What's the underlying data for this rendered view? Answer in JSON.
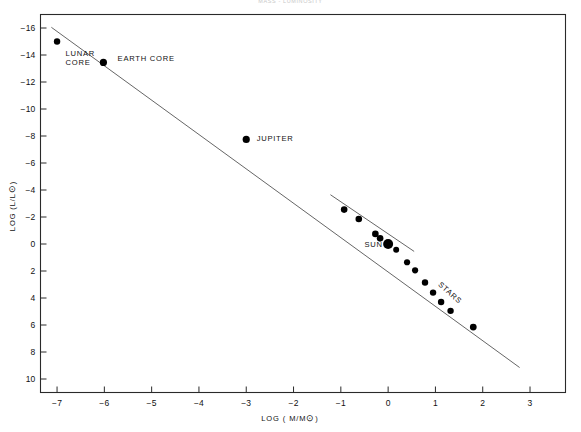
{
  "figure": {
    "faint_header": "MASS - LUMINOSITY",
    "background_color": "#ffffff",
    "ink_color": "#000000",
    "line_color": "#555555"
  },
  "chart_data": {
    "type": "scatter",
    "title": "",
    "xlabel": "LOG ( M/M⊙)",
    "ylabel": "LOG (L/L⊙)",
    "xlim": [
      -7.35,
      3.75
    ],
    "ylim_display_top": -17.0,
    "ylim_display_bottom": 11.0,
    "y_axis_inverted": true,
    "grid": false,
    "legend": "none",
    "xticks": [
      -7,
      -6,
      -5,
      -4,
      -3,
      -2,
      -1,
      0,
      1,
      2,
      3
    ],
    "xtick_labels": [
      "-7",
      "-6",
      "-5",
      "-4",
      "-3",
      "-2",
      "-1",
      "0",
      "1",
      "2",
      "3"
    ],
    "yticks": [
      -16,
      -14,
      -12,
      -10,
      -8,
      -6,
      -4,
      -2,
      0,
      2,
      4,
      6,
      8,
      10
    ],
    "ytick_labels": [
      "-16",
      "-14",
      "-12",
      "-10",
      "-8",
      "-6",
      "-4",
      "-2",
      "0",
      "2",
      "4",
      "6",
      "8",
      "10"
    ],
    "points": [
      {
        "name": "lunar-core",
        "x": -7.0,
        "y": -15.0,
        "r": 3.2
      },
      {
        "name": "earth-core",
        "x": -6.02,
        "y": -13.45,
        "r": 3.6
      },
      {
        "name": "jupiter",
        "x": -3.0,
        "y": -7.75,
        "r": 3.6
      },
      {
        "name": "star-1",
        "x": -0.93,
        "y": -2.55,
        "r": 3.3
      },
      {
        "name": "star-2",
        "x": -0.62,
        "y": -1.85,
        "r": 3.3
      },
      {
        "name": "star-3",
        "x": -0.27,
        "y": -0.75,
        "r": 3.3
      },
      {
        "name": "star-4",
        "x": -0.17,
        "y": -0.42,
        "r": 3.3
      },
      {
        "name": "sun",
        "x": 0.0,
        "y": 0.0,
        "r": 5.0
      },
      {
        "name": "star-5",
        "x": 0.17,
        "y": 0.42,
        "r": 3.0
      },
      {
        "name": "star-6",
        "x": 0.4,
        "y": 1.35,
        "r": 3.1
      },
      {
        "name": "star-7",
        "x": 0.57,
        "y": 1.95,
        "r": 3.1
      },
      {
        "name": "star-8",
        "x": 0.78,
        "y": 2.85,
        "r": 3.2
      },
      {
        "name": "star-9",
        "x": 0.95,
        "y": 3.6,
        "r": 3.2
      },
      {
        "name": "star-10",
        "x": 1.12,
        "y": 4.3,
        "r": 3.2
      },
      {
        "name": "star-11",
        "x": 1.32,
        "y": 4.95,
        "r": 3.2
      },
      {
        "name": "star-12",
        "x": 1.8,
        "y": 6.15,
        "r": 3.4
      }
    ],
    "annotations": [
      {
        "name": "lunar-core-label",
        "text_line1": "LUNAR",
        "text_line2": "CORE",
        "x": -6.82,
        "y": -13.9,
        "rotation": 0
      },
      {
        "name": "earth-core-label",
        "text_line1": "EARTH CORE",
        "text_line2": "",
        "x": -5.72,
        "y": -13.55,
        "rotation": 0
      },
      {
        "name": "jupiter-label",
        "text_line1": "JUPITER",
        "text_line2": "",
        "x": -2.78,
        "y": -7.65,
        "rotation": 0
      },
      {
        "name": "sun-label",
        "text_line1": "SUN",
        "text_line2": "",
        "x": -0.5,
        "y": 0.25,
        "rotation": 0
      },
      {
        "name": "stars-label",
        "text_line1": "STARS",
        "text_line2": "",
        "x": 1.05,
        "y": 3.05,
        "rotation": 42
      }
    ],
    "series": [
      {
        "name": "main-relation-line",
        "type": "line",
        "x": [
          -7.12,
          2.78
        ],
        "y": [
          -16.05,
          9.15
        ]
      },
      {
        "name": "stellar-branch-line",
        "type": "line",
        "x": [
          -1.22,
          0.55
        ],
        "y": [
          -3.65,
          0.55
        ]
      }
    ]
  }
}
